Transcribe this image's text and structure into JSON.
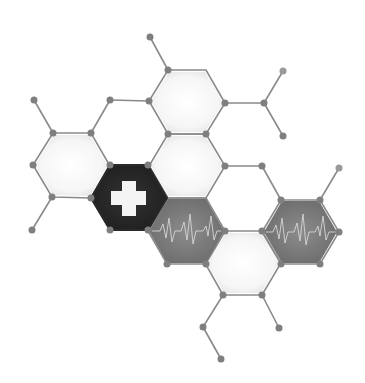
{
  "illustration": {
    "subject": "medical hexagon molecule network",
    "colors": {
      "background": "#ffffff",
      "line": "#8a8a8a",
      "node": "#7f7f7f",
      "hex_light": "#f2f2f2",
      "hex_dark": "#262626",
      "hex_pulse": "#7a7a7a",
      "cross": "#f4f4f4",
      "pulse_line": "#d6d6d6"
    },
    "hexagons": [
      {
        "id": "top",
        "cx": 187,
        "cy": 102,
        "type": "light"
      },
      {
        "id": "left",
        "cx": 72,
        "cy": 165,
        "type": "light"
      },
      {
        "id": "middle",
        "cx": 187,
        "cy": 165,
        "type": "light"
      },
      {
        "id": "cross",
        "cx": 129,
        "cy": 198,
        "type": "dark",
        "icon": "medical-cross-icon"
      },
      {
        "id": "pulse-left",
        "cx": 187,
        "cy": 230,
        "type": "pulse",
        "icon": "heartbeat-icon"
      },
      {
        "id": "bottom",
        "cx": 244,
        "cy": 263,
        "type": "light"
      },
      {
        "id": "pulse-right",
        "cx": 301,
        "cy": 232,
        "type": "pulse",
        "icon": "heartbeat-icon"
      }
    ]
  }
}
